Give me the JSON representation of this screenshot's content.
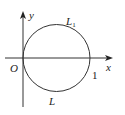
{
  "diagram": {
    "type": "coordinate-plane-circle",
    "axes": {
      "x_label": "x",
      "y_label": "y",
      "origin_label": "O"
    },
    "circle": {
      "upper_arc_label": "L",
      "upper_arc_subscript": "1",
      "lower_arc_label": "L",
      "right_intercept_label": "1"
    },
    "colors": {
      "stroke": "#333333",
      "text": "#222222",
      "background": "#ffffff"
    }
  }
}
